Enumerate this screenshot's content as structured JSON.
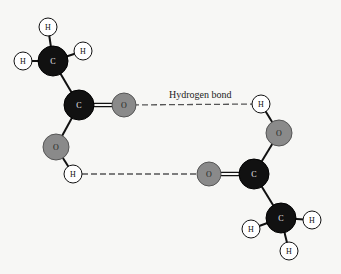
{
  "diagram": {
    "caption": "Hydrogen bond",
    "colors": {
      "background": "#f7f7f5",
      "carbon": "#111111",
      "oxygen": "#8a8a8a",
      "hydrogen": "#ffffff",
      "bond": "#111111",
      "hbond": "#555555"
    },
    "atoms": [
      {
        "id": "h1",
        "element": "H",
        "label": "H",
        "x": 48,
        "y": 27,
        "r": 9
      },
      {
        "id": "h2",
        "element": "H",
        "label": "H",
        "x": 83,
        "y": 51,
        "r": 9
      },
      {
        "id": "h3",
        "element": "H",
        "label": "H",
        "x": 23,
        "y": 61,
        "r": 9
      },
      {
        "id": "c1",
        "element": "C",
        "label": "C",
        "x": 53,
        "y": 61,
        "r": 15
      },
      {
        "id": "c2",
        "element": "C",
        "label": "C",
        "x": 79,
        "y": 105,
        "r": 15
      },
      {
        "id": "o1",
        "element": "O",
        "label": "O",
        "x": 124,
        "y": 105,
        "r": 12
      },
      {
        "id": "o2",
        "element": "O",
        "label": "O",
        "x": 56,
        "y": 147,
        "r": 13
      },
      {
        "id": "h4",
        "element": "H",
        "label": "H",
        "x": 73,
        "y": 174,
        "r": 9
      },
      {
        "id": "h5",
        "element": "H",
        "label": "H",
        "x": 261,
        "y": 104,
        "r": 9
      },
      {
        "id": "o3",
        "element": "O",
        "label": "O",
        "x": 279,
        "y": 133,
        "r": 13
      },
      {
        "id": "c3",
        "element": "C",
        "label": "C",
        "x": 254,
        "y": 174,
        "r": 15
      },
      {
        "id": "o4",
        "element": "O",
        "label": "O",
        "x": 209,
        "y": 174,
        "r": 12
      },
      {
        "id": "c4",
        "element": "C",
        "label": "C",
        "x": 281,
        "y": 218,
        "r": 15
      },
      {
        "id": "h6",
        "element": "H",
        "label": "H",
        "x": 251,
        "y": 229,
        "r": 9
      },
      {
        "id": "h7",
        "element": "H",
        "label": "H",
        "x": 312,
        "y": 220,
        "r": 9
      },
      {
        "id": "h8",
        "element": "H",
        "label": "H",
        "x": 289,
        "y": 251,
        "r": 9
      }
    ],
    "bonds": [
      {
        "from": "c1",
        "to": "h1",
        "type": "single"
      },
      {
        "from": "c1",
        "to": "h2",
        "type": "single"
      },
      {
        "from": "c1",
        "to": "h3",
        "type": "single"
      },
      {
        "from": "c1",
        "to": "c2",
        "type": "single"
      },
      {
        "from": "c2",
        "to": "o1",
        "type": "double"
      },
      {
        "from": "c2",
        "to": "o2",
        "type": "single"
      },
      {
        "from": "o2",
        "to": "h4",
        "type": "single"
      },
      {
        "from": "h5",
        "to": "o3",
        "type": "single"
      },
      {
        "from": "o3",
        "to": "c3",
        "type": "single"
      },
      {
        "from": "c3",
        "to": "o4",
        "type": "double"
      },
      {
        "from": "c3",
        "to": "c4",
        "type": "single"
      },
      {
        "from": "c4",
        "to": "h6",
        "type": "single"
      },
      {
        "from": "c4",
        "to": "h7",
        "type": "single"
      },
      {
        "from": "c4",
        "to": "h8",
        "type": "single"
      }
    ],
    "hydrogen_bonds": [
      {
        "from": "o1",
        "to": "h5",
        "label": "Hydrogen bond"
      },
      {
        "from": "h4",
        "to": "o4",
        "label": ""
      }
    ]
  }
}
